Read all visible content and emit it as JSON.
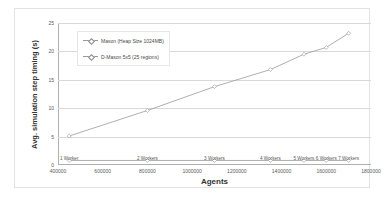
{
  "chart_data": {
    "type": "line",
    "title": "",
    "xlabel": "Agents",
    "ylabel": "Avg. simulation step timing (s)",
    "xlim": [
      400000,
      1800000
    ],
    "ylim": [
      0,
      25
    ],
    "xticks": [
      400000,
      600000,
      800000,
      1000000,
      1200000,
      1400000,
      1600000,
      1800000
    ],
    "xtick_labels": [
      "400000",
      "600000",
      "800000",
      "1000000",
      "1200000",
      "1400000",
      "1600000",
      "1800000"
    ],
    "yticks": [
      0,
      5,
      10,
      15,
      20,
      25
    ],
    "ytick_labels": [
      "0",
      "5",
      "10",
      "15",
      "20",
      "25"
    ],
    "grid": "horizontal",
    "legend_position": "upper-left-inside",
    "series": [
      {
        "name": "Mason (Heap Size 1024MB)",
        "color": "#9a9a9a",
        "x": [
          450000,
          800000,
          1100000,
          1350000,
          1500000,
          1600000,
          1700000
        ],
        "values": [
          5.1,
          9.6,
          13.8,
          16.8,
          19.5,
          20.7,
          23.2
        ]
      },
      {
        "name": "D-Mason 5x5 (25 regions)",
        "color": "#9a9a9a",
        "x": [
          450000,
          800000,
          1100000,
          1350000,
          1500000,
          1600000,
          1700000
        ],
        "values": [
          0.8,
          0.8,
          0.8,
          0.8,
          0.8,
          0.8,
          0.8
        ]
      }
    ],
    "annotations": [
      {
        "text": "1 Worker",
        "x": 450000,
        "y": 1.6
      },
      {
        "text": "2 Workers",
        "x": 800000,
        "y": 1.6
      },
      {
        "text": "3 Workers",
        "x": 1100000,
        "y": 1.6
      },
      {
        "text": "4 Workers",
        "x": 1350000,
        "y": 1.6
      },
      {
        "text": "5 Workers",
        "x": 1500000,
        "y": 1.6
      },
      {
        "text": "6 Workers",
        "x": 1600000,
        "y": 1.6
      },
      {
        "text": "7 Workers",
        "x": 1700000,
        "y": 1.6
      }
    ]
  }
}
